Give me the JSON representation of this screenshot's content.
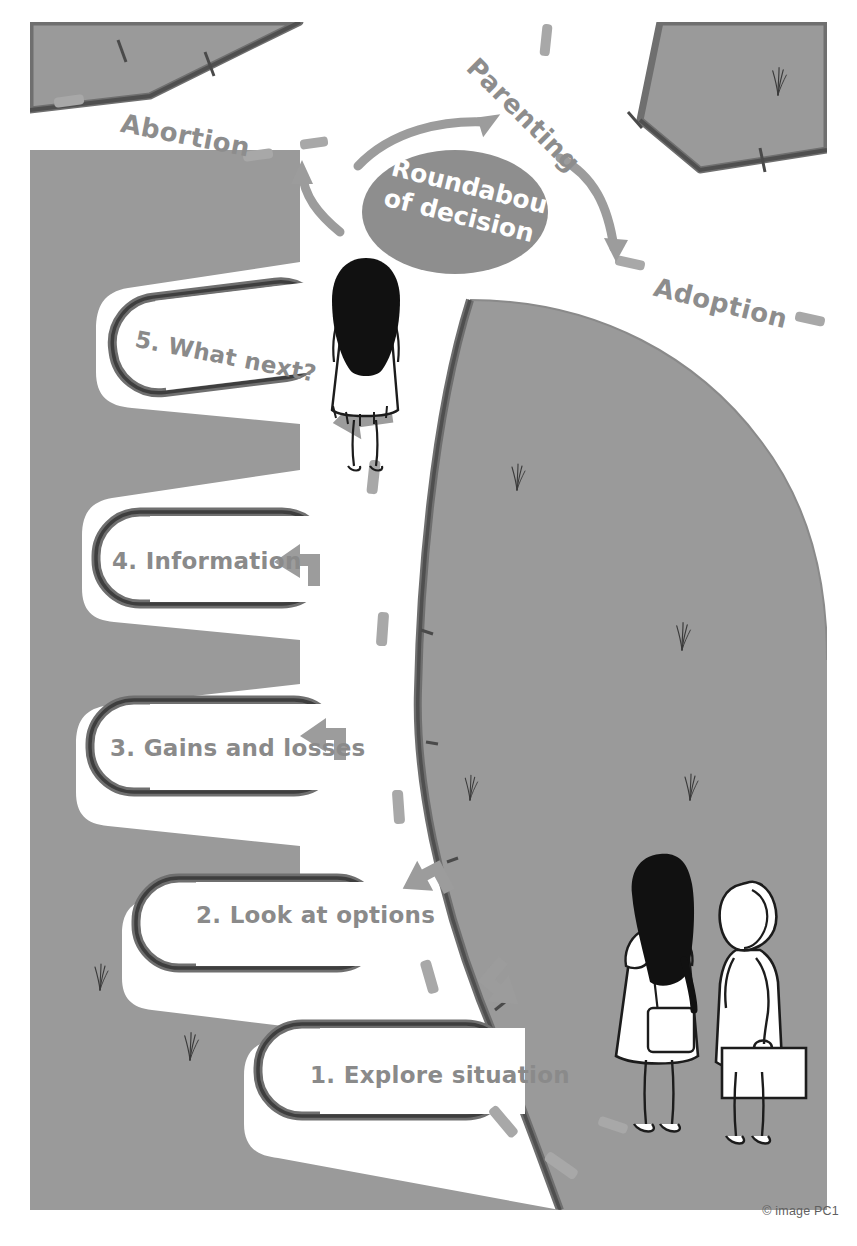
{
  "figure": {
    "title": "Roundabout of decision",
    "credit": "© image PC1",
    "colors": {
      "grass": "#9a9a9a",
      "grass_dark": "#8f8f8f",
      "road": "#ffffff",
      "kerb": "#6f6f6f",
      "kerb_dark": "#4a4a4a",
      "hub_fill": "#8e8e8e",
      "label_text": "#8a8a8a",
      "hub_text": "#ffffff",
      "marking": "#a6a6a6",
      "arrow": "#9c9c9c",
      "ink": "#1c1c1c",
      "credit_text": "#5f5f5f"
    }
  },
  "hub": {
    "line1": "Roundabout",
    "line2": "of decision"
  },
  "exits": [
    {
      "name": "exit-abortion",
      "label": "Abortion"
    },
    {
      "name": "exit-parenting",
      "label": "Parenting"
    },
    {
      "name": "exit-adoption",
      "label": "Adoption"
    }
  ],
  "steps": [
    {
      "name": "step-1",
      "label": "1. Explore situation"
    },
    {
      "name": "step-2",
      "label": "2. Look at options"
    },
    {
      "name": "step-3",
      "label": "3. Gains and losses"
    },
    {
      "name": "step-4",
      "label": "4. Information"
    },
    {
      "name": "step-5",
      "label": "5. What next?"
    }
  ],
  "figures": [
    {
      "name": "walking-woman",
      "description": "woman with long black hair walking towards the roundabout"
    },
    {
      "name": "standing-woman-with-bag",
      "description": "woman with long black hair and shoulder bag"
    },
    {
      "name": "standing-woman-with-briefcase",
      "description": "woman with short hair holding a briefcase"
    }
  ]
}
